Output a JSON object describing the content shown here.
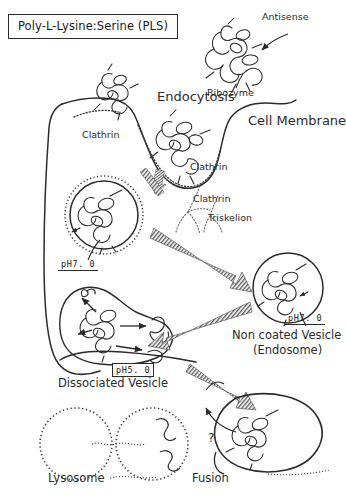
{
  "figure": {
    "title": "Poly-L-Lysine:Serine  (PLS)",
    "kind": "hand-drawn cell-biology schematic of PLS/antisense-ribozyme endocytosis"
  },
  "labels": {
    "antisense": "Antisense",
    "ribozyme": "Ribozyme",
    "endocytosis": "Endocytosis",
    "cell_membrane": "Cell Membrane",
    "clathrin_1": "Clathrin",
    "clathrin_2": "Clathrin",
    "clathrin_3": "Clathrin",
    "triskelion": "Triskelion",
    "non_coated_vesicle": "Non coated Vesicle",
    "endosome": "(Endosome)",
    "dissociated_vesicle": "Dissociated Vesicle",
    "lysosome": "Lysosome",
    "fusion": "Fusion",
    "question_mark": "?"
  },
  "ph_tags": {
    "coated_vesicle": "pH7. 0",
    "non_coated_vesicle": "pH7. 0",
    "dissociated_vesicle": "pH5. 0"
  },
  "colors": {
    "ink": "#2b2b2b",
    "background": "#ffffff",
    "hatch": "#4a4a4a"
  }
}
